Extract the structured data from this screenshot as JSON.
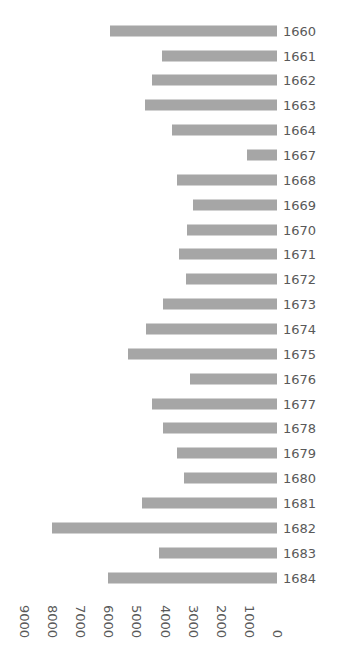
{
  "chart_data": {
    "type": "bar",
    "orientation": "horizontal",
    "rotation_degrees": 180,
    "title": "",
    "subtitle": "",
    "xlabel": "",
    "ylabel": "",
    "xlim": [
      0,
      9000
    ],
    "grid": false,
    "legend": null,
    "bar_color": "#a6a6a6",
    "text_color": "#595959",
    "background_color": "#ffffff",
    "xticks": [
      9000,
      8000,
      7000,
      6000,
      5000,
      4000,
      3000,
      2000,
      1000,
      0
    ],
    "xtick_labels": [
      "9000",
      "8000",
      "7000",
      "6000",
      "5000",
      "4000",
      "3000",
      "2000",
      "1000",
      "0"
    ],
    "categories": [
      "1684",
      "1683",
      "1682",
      "1681",
      "1680",
      "1679",
      "1678",
      "1677",
      "1676",
      "1675",
      "1674",
      "1673",
      "1672",
      "1671",
      "1670",
      "1669",
      "1668",
      "1667",
      "1664",
      "1663",
      "1662",
      "1661",
      "1660"
    ],
    "values": [
      6000,
      4200,
      8000,
      4800,
      3300,
      3550,
      4050,
      4450,
      3100,
      5300,
      4650,
      4050,
      3250,
      3500,
      3200,
      3000,
      3550,
      1050,
      3750,
      4700,
      4450,
      4100,
      5950
    ],
    "points": [
      {
        "category": "1684",
        "value": 6000
      },
      {
        "category": "1683",
        "value": 4200
      },
      {
        "category": "1682",
        "value": 8000
      },
      {
        "category": "1681",
        "value": 4800
      },
      {
        "category": "1680",
        "value": 3300
      },
      {
        "category": "1679",
        "value": 3550
      },
      {
        "category": "1678",
        "value": 4050
      },
      {
        "category": "1677",
        "value": 4450
      },
      {
        "category": "1676",
        "value": 3100
      },
      {
        "category": "1675",
        "value": 5300
      },
      {
        "category": "1674",
        "value": 4650
      },
      {
        "category": "1673",
        "value": 4050
      },
      {
        "category": "1672",
        "value": 3250
      },
      {
        "category": "1671",
        "value": 3500
      },
      {
        "category": "1670",
        "value": 3200
      },
      {
        "category": "1669",
        "value": 3000
      },
      {
        "category": "1668",
        "value": 3550
      },
      {
        "category": "1667",
        "value": 1050
      },
      {
        "category": "1664",
        "value": 3750
      },
      {
        "category": "1663",
        "value": 4700
      },
      {
        "category": "1662",
        "value": 4450
      },
      {
        "category": "1661",
        "value": 4100
      },
      {
        "category": "1660",
        "value": 5950
      }
    ]
  }
}
